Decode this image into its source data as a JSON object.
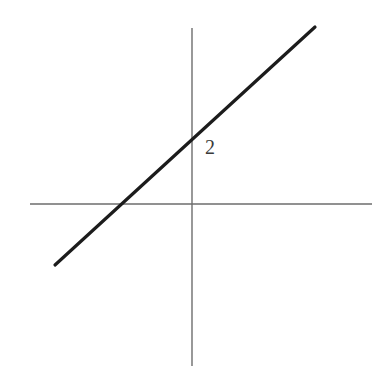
{
  "figure": {
    "background_color": "#ffffff",
    "width": 386,
    "height": 379,
    "axis_color": "#6d6d6d",
    "line_color": "#1c1c1c",
    "label_color": "#3a3a3a"
  },
  "labels": {
    "y_intercept_label": "2"
  },
  "chart_data": {
    "type": "line",
    "title": "",
    "subtitle": "",
    "xlabel": "",
    "ylabel": "",
    "grid": false,
    "legend": null,
    "axes": {
      "x_axis": {
        "name": "x-axis",
        "orientation": "horizontal",
        "pixel_y": 204,
        "pixel_x_start": 30,
        "pixel_x_end": 372,
        "tick_labels": [],
        "arrowheads": false
      },
      "y_axis": {
        "name": "y-axis",
        "orientation": "vertical",
        "pixel_x": 192,
        "pixel_y_start": 28,
        "pixel_y_end": 366,
        "tick_labels": [],
        "arrowheads": false
      },
      "origin_pixel": [
        192,
        204
      ]
    },
    "series": [
      {
        "name": "line",
        "kind": "straight-line-segment",
        "pixel_points": [
          [
            55,
            265
          ],
          [
            315,
            27
          ]
        ],
        "slope_pixels": -0.9154,
        "annotations": [
          {
            "text": "2",
            "meaning": "y-intercept value",
            "pixel_anchor": [
              192,
              137
            ],
            "label_pixel_position": [
              205,
              137
            ]
          }
        ],
        "intercepts": {
          "y_intercept_pixel": [
            192,
            137
          ],
          "x_intercept_pixel": [
            124,
            204
          ]
        }
      }
    ]
  }
}
